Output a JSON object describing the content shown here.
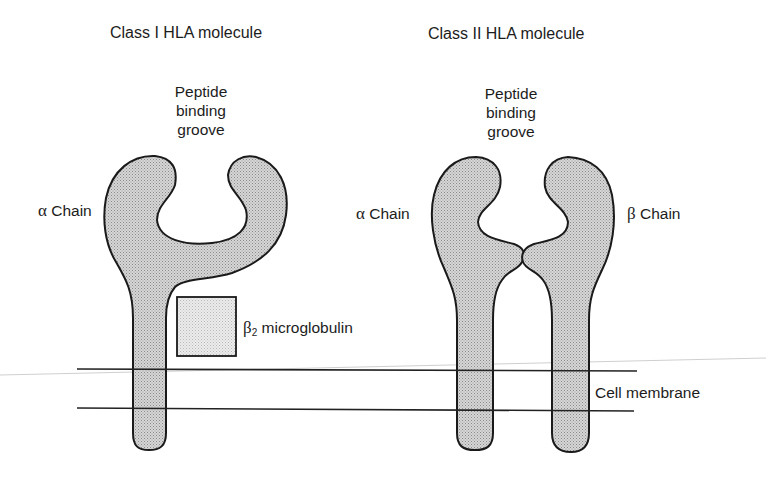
{
  "class1": {
    "title": "Class I HLA molecule",
    "groove_label": [
      "Peptide",
      "binding",
      "groove"
    ],
    "alpha_label_symbol": "α",
    "alpha_label_text": "Chain",
    "b2m_symbol": "β",
    "b2m_sub": "2",
    "b2m_text": "microglobulin"
  },
  "class2": {
    "title": "Class II HLA molecule",
    "groove_label": [
      "Peptide",
      "binding",
      "groove"
    ],
    "alpha_label_symbol": "α",
    "alpha_label_text": "Chain",
    "beta_label_symbol": "β",
    "beta_label_text": "Chain"
  },
  "membrane": {
    "label": "Cell membrane"
  },
  "colors": {
    "protein_fill": "#c8c8c8",
    "b2m_fill": "#e4e4e4",
    "outline": "#1a1a1a",
    "membrane_line": "#222222",
    "faint_line": "#c8c8c8"
  }
}
